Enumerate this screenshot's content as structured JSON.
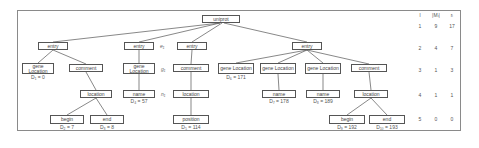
{
  "tree": {
    "root": {
      "label": "uniprot"
    },
    "nodes": [
      {
        "id": "e1",
        "label": "entry",
        "x": 38,
        "y": 42,
        "w": 30,
        "h": 8
      },
      {
        "id": "gl1",
        "label": "gene Location",
        "x": 22,
        "y": 63,
        "w": 32,
        "h": 11,
        "d": "D₁ = 0"
      },
      {
        "id": "c1",
        "label": "comment",
        "x": 69,
        "y": 64,
        "w": 34,
        "h": 8
      },
      {
        "id": "loc1",
        "label": "location",
        "x": 80,
        "y": 90,
        "w": 32,
        "h": 8
      },
      {
        "id": "b1",
        "label": "begin",
        "x": 50,
        "y": 115,
        "w": 34,
        "h": 9,
        "d": "D₂ = 7"
      },
      {
        "id": "end1",
        "label": "end",
        "x": 90,
        "y": 115,
        "w": 34,
        "h": 9,
        "d": "D₃ = 8"
      },
      {
        "id": "e2",
        "label": "entry",
        "x": 124,
        "y": 42,
        "w": 30,
        "h": 8,
        "side": "e₁"
      },
      {
        "id": "gl2",
        "label": "gene Location",
        "x": 123,
        "y": 63,
        "w": 32,
        "h": 11,
        "side": "g₁"
      },
      {
        "id": "n1",
        "label": "name",
        "x": 123,
        "y": 90,
        "w": 32,
        "h": 8,
        "side": "n₁",
        "d": "D₄ = 57"
      },
      {
        "id": "e3",
        "label": "entry",
        "x": 177,
        "y": 42,
        "w": 30,
        "h": 8
      },
      {
        "id": "c2",
        "label": "comment",
        "x": 173,
        "y": 64,
        "w": 36,
        "h": 8
      },
      {
        "id": "loc2",
        "label": "location",
        "x": 173,
        "y": 90,
        "w": 36,
        "h": 8
      },
      {
        "id": "pos",
        "label": "position",
        "x": 173,
        "y": 115,
        "w": 36,
        "h": 9,
        "d": "D₅ = 114"
      },
      {
        "id": "e4",
        "label": "entry",
        "x": 292,
        "y": 42,
        "w": 30,
        "h": 8
      },
      {
        "id": "gl3",
        "label": "gene Location",
        "x": 218,
        "y": 63,
        "w": 36,
        "h": 11,
        "d": "D₆ = 171"
      },
      {
        "id": "gl4",
        "label": "gene Location",
        "x": 260,
        "y": 63,
        "w": 36,
        "h": 11
      },
      {
        "id": "n2",
        "label": "name",
        "x": 262,
        "y": 90,
        "w": 34,
        "h": 8,
        "d": "D₇ = 178"
      },
      {
        "id": "gl5",
        "label": "gene Location",
        "x": 305,
        "y": 63,
        "w": 36,
        "h": 11
      },
      {
        "id": "n3",
        "label": "name",
        "x": 306,
        "y": 90,
        "w": 34,
        "h": 8,
        "d": "D₈ = 189"
      },
      {
        "id": "c3",
        "label": "comment",
        "x": 351,
        "y": 64,
        "w": 36,
        "h": 8
      },
      {
        "id": "loc3",
        "label": "location",
        "x": 354,
        "y": 90,
        "w": 34,
        "h": 8
      },
      {
        "id": "b3",
        "label": "begin",
        "x": 329,
        "y": 115,
        "w": 36,
        "h": 9,
        "d": "D₉ = 192"
      },
      {
        "id": "end3",
        "label": "end",
        "x": 369,
        "y": 115,
        "w": 36,
        "h": 9,
        "d": "D₁₀ = 193"
      }
    ]
  },
  "table": {
    "headers": [
      "l",
      "|Mₗ|",
      "rₗ"
    ],
    "rows": [
      [
        "1",
        "9",
        "17"
      ],
      [
        "2",
        "4",
        "7"
      ],
      [
        "3",
        "1",
        "3"
      ],
      [
        "4",
        "1",
        "1"
      ],
      [
        "5",
        "0",
        "0"
      ]
    ]
  }
}
